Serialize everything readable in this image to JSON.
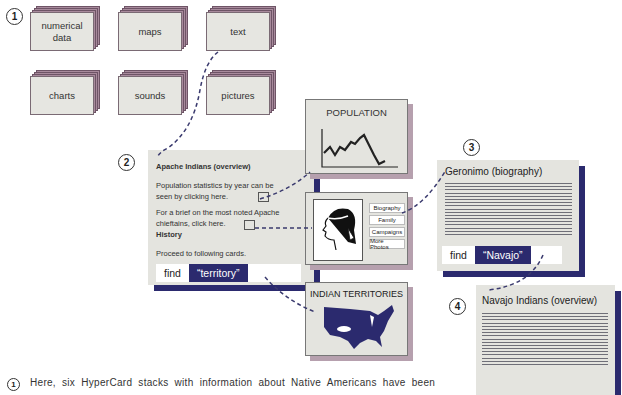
{
  "step_markers": [
    "1",
    "2",
    "3",
    "4"
  ],
  "stacks": [
    {
      "label": "numerical data"
    },
    {
      "label": "maps"
    },
    {
      "label": "text"
    },
    {
      "label": "charts"
    },
    {
      "label": "sounds"
    },
    {
      "label": "pictures"
    }
  ],
  "apache_card": {
    "title": "Apache Indians (overview)",
    "para1": "Population statistics by year can be seen by clicking here.",
    "para2": "For a brief on the most noted Apache chieftains, click here.",
    "history": "History",
    "proceed": "Proceed to following cards.",
    "find_label": "find",
    "find_value": "“territory”"
  },
  "population_card": {
    "title": "POPULATION"
  },
  "portrait_card": {
    "buttons": [
      "Biography",
      "Family",
      "Campaigns",
      "More Photos"
    ]
  },
  "territories_card": {
    "title": "INDIAN TERRITORIES"
  },
  "geronimo_card": {
    "title": "Geronimo (biography)",
    "find_label": "find",
    "find_value": "“Navajo”"
  },
  "navajo_card": {
    "title": "Navajo Indians (overview)"
  },
  "caption": {
    "marker": "1",
    "text": "Here, six HyperCard stacks with information about Native Americans have been"
  },
  "colors": {
    "navy": "#2b2a6e",
    "card_gray": "#e4e4df",
    "stack_mauve": "#a88a9c"
  }
}
